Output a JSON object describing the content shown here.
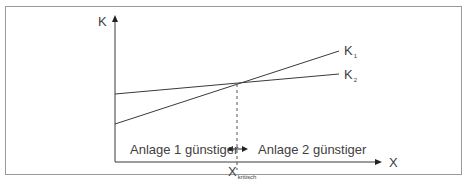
{
  "diagram": {
    "y_axis_label": "K",
    "x_axis_label": "X",
    "lines": [
      {
        "name": "K",
        "subscript": "1",
        "description": "steeper line"
      },
      {
        "name": "K",
        "subscript": "2",
        "description": "flatter line"
      }
    ],
    "critical_point": {
      "label": "X",
      "subscript": "kritisch"
    },
    "region_left": "Anlage 1 günstiger",
    "region_right": "Anlage 2 günstiger",
    "colors": {
      "line": "#3a3a3a",
      "frame": "#9a9a9a",
      "text": "#404040"
    }
  }
}
